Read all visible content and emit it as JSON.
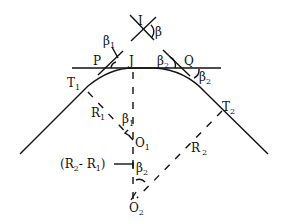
{
  "diagram": {
    "labels": {
      "I": "I",
      "beta": "β",
      "beta1_top": "β",
      "beta1_top_sub": "1",
      "P": "P",
      "J": "J",
      "beta2_left": "β",
      "beta2_left_sub": "2",
      "Q": "Q",
      "beta2_right": "β",
      "beta2_right_sub": "2",
      "T1": "T",
      "T1_sub": "1",
      "T2": "T",
      "T2_sub": "2",
      "R1": "R",
      "R1_sub": "1",
      "beta1_center": "β",
      "beta1_center_sub": "1",
      "O1": "O",
      "O1_sub": "1",
      "R2": "R",
      "R2_sub": "2",
      "diff_open": "(R",
      "diff_sub2": "2",
      "diff_mid": "- R",
      "diff_sub1": "1",
      "diff_close": ")",
      "beta2_center": "β",
      "beta2_center_sub": "2",
      "O2": "O",
      "O2_sub": "2"
    }
  }
}
